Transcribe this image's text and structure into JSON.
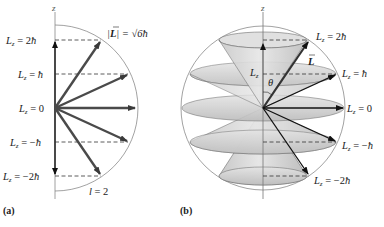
{
  "panel_a": {
    "caption": "(a)",
    "axis_label": "z",
    "magnitude_label": "|L| = √6ħ",
    "magnitude_parts": {
      "prefix": "|",
      "vec": "L",
      "suffix": "| = ",
      "root": "√6",
      "hbar": "ħ"
    },
    "quantum_number_label": "l = 2",
    "levels": [
      {
        "label": "Lz = 2ħ",
        "value": "2ħ"
      },
      {
        "label": "Lz = ħ",
        "value": "ħ"
      },
      {
        "label": "Lz = 0",
        "value": "0"
      },
      {
        "label": "Lz = −ħ",
        "value": "−ħ"
      },
      {
        "label": "Lz = −2ħ",
        "value": "−2ħ"
      }
    ]
  },
  "panel_b": {
    "caption": "(b)",
    "axis_label": "z",
    "vector_label": "L",
    "component_label": "Lz",
    "angle_label": "θ",
    "levels": [
      {
        "label": "Lz = 2ħ",
        "value": "2ħ"
      },
      {
        "label": "Lz = ħ",
        "value": "ħ"
      },
      {
        "label": "Lz = 0",
        "value": "0"
      },
      {
        "label": "Lz = −ħ",
        "value": "−ħ"
      },
      {
        "label": "Lz = −2ħ",
        "value": "−2ħ"
      }
    ]
  },
  "lz_symbol": {
    "main": "L",
    "sub": "z"
  },
  "colors": {
    "arrow": "#4a4a4a",
    "arrow_dark": "#1a1a1a",
    "circle": "#8a8a8a",
    "cone_fill": "#d4d4d4",
    "cone_edge": "#6f6f6f",
    "dash": "#333333"
  }
}
